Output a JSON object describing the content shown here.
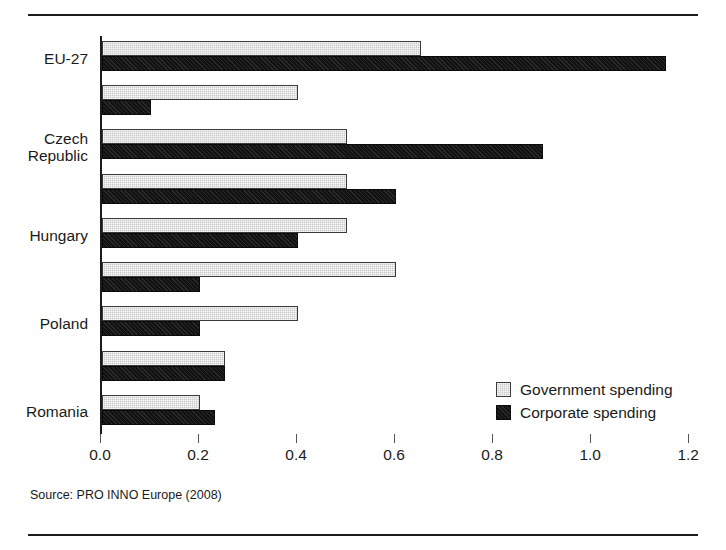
{
  "figure": {
    "source_note": "Source: PRO INNO Europe (2008)"
  },
  "legend": {
    "position": "inside-bottom-right",
    "entries": [
      {
        "label": "Government spending",
        "icon": "legend-swatch-gray-hatched",
        "color": "#c9c9c9"
      },
      {
        "label": "Corporate spending",
        "icon": "legend-swatch-black",
        "color": "#121212"
      }
    ]
  },
  "chart_data": {
    "type": "bar",
    "orientation": "horizontal",
    "title": "",
    "subtitle": "",
    "xlabel": "",
    "ylabel": "",
    "xlim": [
      0.0,
      1.22
    ],
    "grid": false,
    "legend_position": "inside-bottom-right",
    "xticks": [
      "0.0",
      "0.2",
      "0.4",
      "0.6",
      "0.8",
      "1.0",
      "1.2"
    ],
    "xtick_values": [
      0.0,
      0.2,
      0.4,
      0.6,
      0.8,
      1.0,
      1.2
    ],
    "categories": [
      "EU-27",
      "",
      "Czech\nRepublic",
      "",
      "Hungary",
      "",
      "Poland",
      "",
      "Romania"
    ],
    "series": [
      {
        "name": "Government spending",
        "color": "#c9c9c9",
        "values": [
          0.65,
          0.4,
          0.5,
          0.5,
          0.5,
          0.6,
          0.4,
          0.25,
          0.2
        ]
      },
      {
        "name": "Corporate spending",
        "color": "#121212",
        "values": [
          1.15,
          0.1,
          0.9,
          0.6,
          0.4,
          0.2,
          0.2,
          0.25,
          0.23
        ]
      }
    ],
    "annotations": []
  }
}
